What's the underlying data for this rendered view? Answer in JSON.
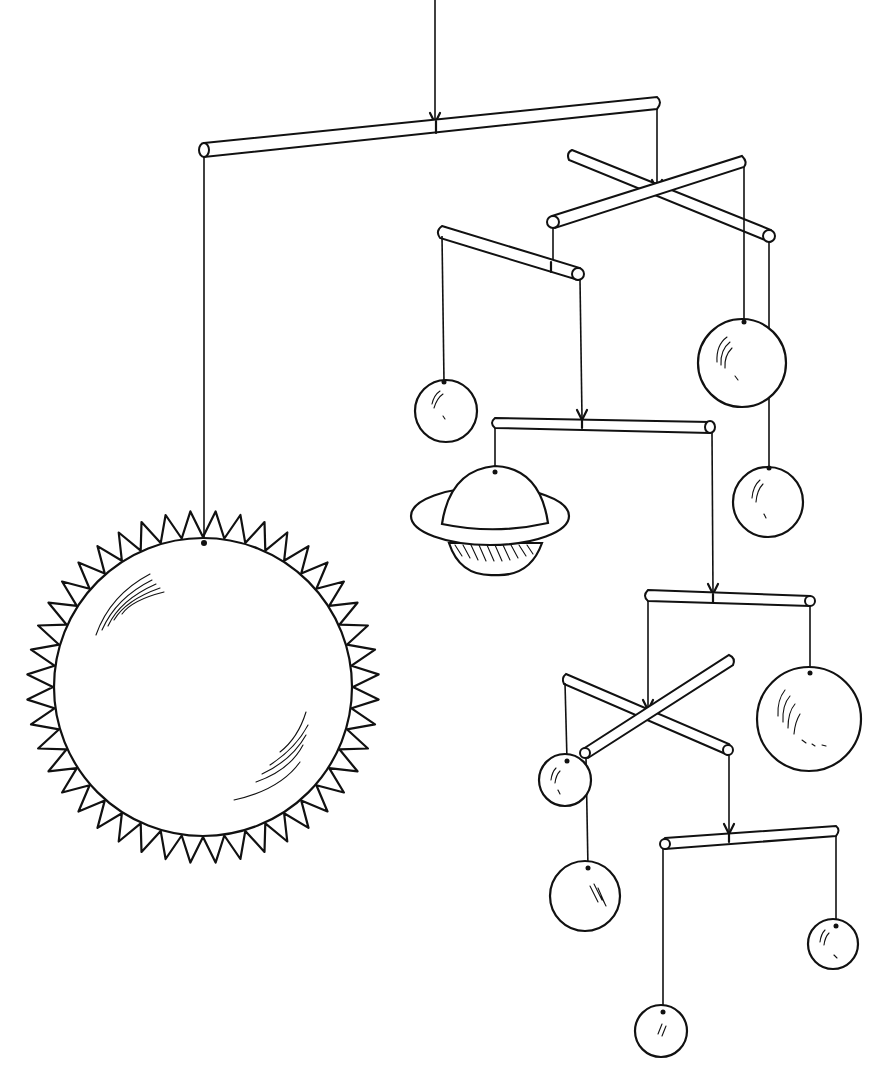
{
  "image": {
    "title": "Solar system hanging mobile line drawing",
    "background": "#ffffff",
    "ink": "#111111",
    "elements": {
      "sun": {
        "cx": 203,
        "cy": 687,
        "r": 150,
        "spikes": 44
      },
      "saturn": {
        "cx": 490,
        "cy": 515
      },
      "planets": [
        {
          "name": "planet-upper-left",
          "cx": 446,
          "cy": 411,
          "r": 31
        },
        {
          "name": "planet-upper-right",
          "cx": 742,
          "cy": 363,
          "r": 44
        },
        {
          "name": "planet-mid-right",
          "cx": 768,
          "cy": 502,
          "r": 36
        },
        {
          "name": "planet-large-right",
          "cx": 809,
          "cy": 719,
          "r": 53
        },
        {
          "name": "planet-small-left",
          "cx": 565,
          "cy": 780,
          "r": 27
        },
        {
          "name": "planet-lower-left",
          "cx": 585,
          "cy": 896,
          "r": 36
        },
        {
          "name": "planet-lower-right",
          "cx": 833,
          "cy": 944,
          "r": 25
        },
        {
          "name": "planet-bottom",
          "cx": 661,
          "cy": 1031,
          "r": 26
        }
      ]
    }
  }
}
